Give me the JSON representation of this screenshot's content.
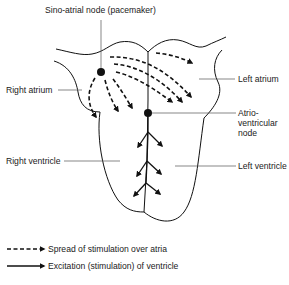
{
  "diagram": {
    "labels": {
      "sa_node": "Sino-atrial node (pacemaker)",
      "right_atrium": "Right atrium",
      "left_atrium": "Left atrium",
      "av_node_1": "Atrio-",
      "av_node_2": "ventricular",
      "av_node_3": "node",
      "right_ventricle": "Right ventricle",
      "left_ventricle": "Left ventricle"
    },
    "legend": [
      {
        "style": "dashed-arrow",
        "label": "Spread of stimulation over atria"
      },
      {
        "style": "solid-arrow",
        "label": "Excitation (stimulation) of ventricle"
      }
    ]
  }
}
